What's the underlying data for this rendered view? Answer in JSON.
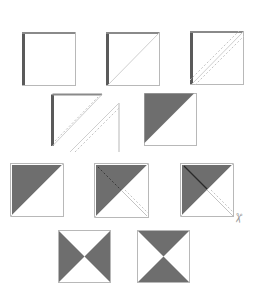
{
  "diagram": {
    "type": "quilting-half-square-triangle-steps",
    "colors": {
      "background": "#ffffff",
      "outline": "#b8b8b8",
      "dark_fabric": "#6e6e6e",
      "seam_edge": "#5a5a5a",
      "guide_line": "#cfcfcf",
      "dashed_line": "#c4c4c4"
    },
    "rows": [
      {
        "label": "step-1-3",
        "blocks": [
          {
            "id": "square-plain",
            "x": 22,
            "y": 32,
            "size": 53,
            "diagonal": false,
            "dashed": false,
            "dark": false
          },
          {
            "id": "square-diagonal",
            "x": 106,
            "y": 32,
            "size": 53,
            "diagonal": true,
            "dashed": false,
            "dark": false
          },
          {
            "id": "square-sewn-seams",
            "x": 190,
            "y": 31,
            "size": 53,
            "diagonal": true,
            "dashed": true,
            "dark": false
          }
        ]
      },
      {
        "label": "step-4-5",
        "blocks": [
          {
            "id": "square-cut-apart",
            "x": 52,
            "y": 94,
            "size": 52,
            "split": true
          },
          {
            "id": "hst-pressed",
            "x": 144,
            "y": 93,
            "size": 52,
            "dark": "upper-left"
          }
        ]
      },
      {
        "label": "step-6-8",
        "blocks": [
          {
            "id": "hst-plain",
            "x": 10,
            "y": 163,
            "size": 53,
            "dark": "upper-left",
            "extra": "none"
          },
          {
            "id": "hst-marked",
            "x": 94,
            "y": 163,
            "size": 54,
            "dark": "upper-left",
            "extra": "dashed-cross"
          },
          {
            "id": "hst-sewn",
            "x": 180,
            "y": 163,
            "size": 53,
            "dark": "upper-left",
            "extra": "solid-cross"
          }
        ]
      },
      {
        "label": "step-9",
        "blocks": [
          {
            "id": "hourglass-vertical",
            "x": 58,
            "y": 230,
            "size": 52,
            "dark": "left-right"
          },
          {
            "id": "hourglass-horizontal",
            "x": 137,
            "y": 230,
            "size": 52,
            "dark": "top-bottom"
          }
        ]
      }
    ],
    "icons": [
      {
        "name": "scissors-icon",
        "x": 233,
        "y": 216,
        "glyph": "✂"
      }
    ]
  }
}
